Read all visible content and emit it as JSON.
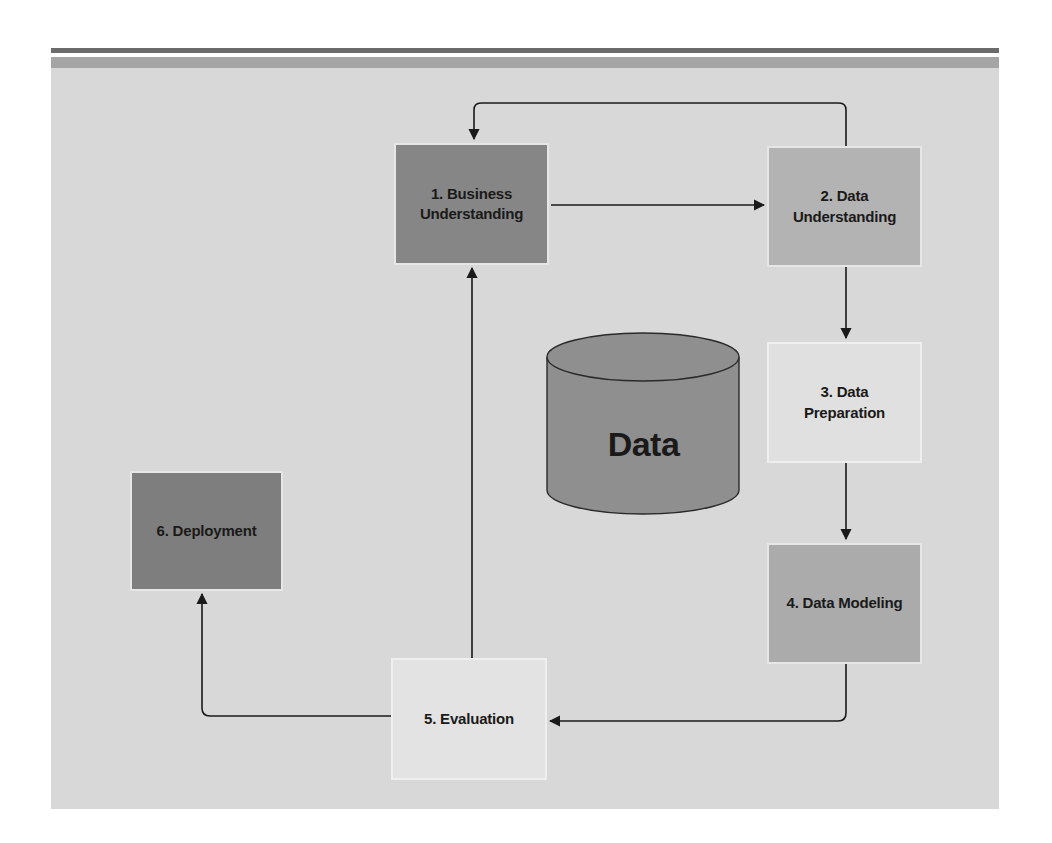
{
  "diagram": {
    "title": "",
    "center_store": {
      "label": "Data",
      "shape": "cylinder",
      "color": "#8f8f8f"
    },
    "steps": [
      {
        "id": 1,
        "label": "1. Business Understanding",
        "line1": "1. Business",
        "line2": "Understanding",
        "color": "#868686"
      },
      {
        "id": 2,
        "label": "2. Data Understanding",
        "line1": "2. Data",
        "line2": "Understanding",
        "color": "#b3b3b3"
      },
      {
        "id": 3,
        "label": "3. Data Preparation",
        "line1": "3. Data",
        "line2": "Preparation",
        "color": "#e0e0e0"
      },
      {
        "id": 4,
        "label": "4. Data Modeling",
        "line1": "4. Data Modeling",
        "line2": "",
        "color": "#ababab"
      },
      {
        "id": 5,
        "label": "5. Evaluation",
        "line1": "5. Evaluation",
        "line2": "",
        "color": "#e3e3e3"
      },
      {
        "id": 6,
        "label": "6. Deployment",
        "line1": "6. Deployment",
        "line2": "",
        "color": "#7e7e7e"
      }
    ],
    "edges": [
      {
        "from": 1,
        "to": 2
      },
      {
        "from": 2,
        "to": 1,
        "type": "feedback-loop"
      },
      {
        "from": 2,
        "to": 3
      },
      {
        "from": 3,
        "to": 4
      },
      {
        "from": 4,
        "to": 5
      },
      {
        "from": 5,
        "to": 1
      },
      {
        "from": 5,
        "to": 6
      }
    ],
    "colors": {
      "panel": "#d8d8d8",
      "header_bar_dark": "#6b6b6b",
      "header_bar_mid": "#a5a5a5",
      "arrow": "#1a1a1a"
    }
  }
}
